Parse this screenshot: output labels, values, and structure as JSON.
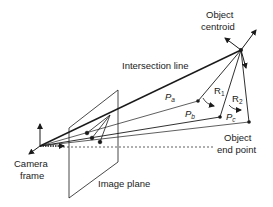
{
  "diagram": {
    "type": "camera-projection-geometry",
    "labels": {
      "object_centroid_line1": "Object",
      "object_centroid_line2": "centroid",
      "intersection_line": "Intersection line",
      "camera_frame_line1": "Camera",
      "camera_frame_line2": "frame",
      "image_plane": "Image plane",
      "object_end_point_line1": "Object",
      "object_end_point_line2": "end point",
      "pa_main": "P",
      "pa_sub": "a",
      "pb_main": "P",
      "pb_sub": "b",
      "pc_main": "P",
      "pc_sub": "c",
      "r1_main": "R",
      "r1_sub": "1",
      "r2_main": "R",
      "r2_sub": "2"
    },
    "colors": {
      "stroke": "#1a1a1a",
      "background": "#ffffff"
    }
  }
}
